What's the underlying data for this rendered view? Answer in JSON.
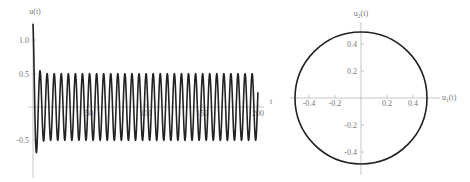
{
  "chart_data": [
    {
      "type": "line",
      "title": "",
      "xlabel": "t",
      "ylabel": "u(t)",
      "xlim": [
        0,
        200
      ],
      "ylim": [
        -0.85,
        1.2
      ],
      "x_ticks": [
        50,
        100,
        150,
        200
      ],
      "x_tick_labels": [
        "50",
        "100",
        "150",
        "200"
      ],
      "y_ticks": [
        1.0,
        0.5,
        -0.5
      ],
      "y_tick_labels": [
        "1.0",
        "0.5",
        "-0.5"
      ],
      "grid": false,
      "legend": null,
      "series": [
        {
          "name": "u(t)",
          "description": "oscillation with initial transient settling to steady amplitude 0.5, angular frequency ~1",
          "omega": 1.0,
          "steady_amplitude": 0.5,
          "initial_value": 1.15,
          "first_min": -0.85,
          "first_max_after_transient": 0.65,
          "approx_cycles": 32
        }
      ]
    },
    {
      "type": "line",
      "title": "",
      "xlabel": "u1(t)",
      "ylabel": "u2(t)",
      "xlim": [
        -0.5,
        0.5
      ],
      "ylim": [
        -0.5,
        0.5
      ],
      "x_ticks": [
        -0.4,
        -0.2,
        0.2,
        0.4
      ],
      "x_tick_labels": [
        "-0.4",
        "-0.2",
        "0.2",
        "0.4"
      ],
      "y_ticks": [
        0.4,
        0.2,
        -0.2,
        -0.4
      ],
      "y_tick_labels": [
        "0.4",
        "0.2",
        "-0.2",
        "-0.4"
      ],
      "grid": false,
      "legend": null,
      "series": [
        {
          "name": "phase portrait",
          "description": "closed circular orbit (limit cycle) centered at origin",
          "center": [
            0,
            0
          ],
          "radius": 0.5
        }
      ]
    }
  ],
  "left": {
    "ylabel": "u(t)",
    "xlabel": "t",
    "x_tick_labels": [
      "50",
      "100",
      "150",
      "200"
    ],
    "y_tick_labels": [
      "1.0",
      "0.5",
      "-0.5"
    ]
  },
  "right": {
    "ylabel_base": "u",
    "ylabel_sub": "2",
    "ylabel_arg": "(t)",
    "xlabel_base": "u",
    "xlabel_sub": "1",
    "xlabel_arg": "(t)",
    "x_tick_labels": [
      "-0.4",
      "-0.2",
      "0.2",
      "0.4"
    ],
    "y_tick_labels": [
      "0.4",
      "0.2",
      "-0.2",
      "-0.4"
    ]
  },
  "colors": {
    "curve": "#222222",
    "axis": "#b8b8b8",
    "label": "#777777"
  }
}
